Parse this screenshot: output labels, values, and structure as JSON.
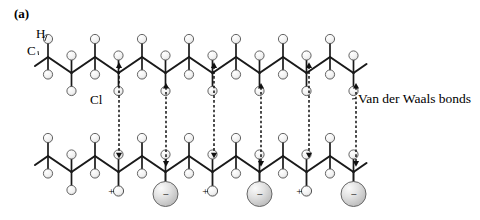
{
  "figure": {
    "panel_label": "(a)",
    "caption_labels": {
      "hydrogen": "H",
      "carbon": "C",
      "chlorine": "Cl",
      "vdw": "Van der Waals bonds"
    },
    "charge_signs": {
      "negative": "−",
      "positive": "+"
    }
  },
  "colors": {
    "carbon": "#2b2b2b",
    "carbon_highlight": "#8a8a8a",
    "hydrogen": "#f2f2f2",
    "hydrogen_outline": "#555555",
    "chlorine": "#d0d0d0",
    "chlorine_outline": "#666666",
    "bond": "#1a1a1a",
    "background": "#ffffff",
    "text": "#000000"
  },
  "geometry": {
    "chain_top": {
      "carbon_y_upper": 57,
      "carbon_y_lower": 73,
      "x_start": 48,
      "x_step": 23.5,
      "count": 14
    },
    "chain_bottom": {
      "carbon_y_upper": 156,
      "carbon_y_lower": 172,
      "x_start": 48,
      "x_step": 23.5,
      "count": 14
    },
    "carbon_radius": 10.5,
    "hydrogen_radius": 4.6,
    "chlorine_radius": 12.5
  },
  "chain_top": {
    "name": "upper-polymer-chain",
    "chlorine_x": [
      119,
      214,
      309
    ],
    "hydrogen_plus_x": [
      166,
      261,
      356
    ],
    "chlorine_y": 48,
    "substituent_label": "Cl"
  },
  "chain_bottom": {
    "name": "lower-polymer-chain",
    "chlorine_x": [
      166,
      261,
      356
    ],
    "hydrogen_plus_x": [
      119,
      214,
      309
    ],
    "chlorine_y": 181,
    "substituent_label": "Cl"
  },
  "interchain": {
    "pairs": [
      {
        "x": 119,
        "top": "chlorine",
        "bottom": "hydrogen"
      },
      {
        "x": 166,
        "top": "hydrogen",
        "bottom": "chlorine"
      },
      {
        "x": 214,
        "top": "chlorine",
        "bottom": "hydrogen"
      },
      {
        "x": 261,
        "top": "hydrogen",
        "bottom": "chlorine"
      },
      {
        "x": 309,
        "top": "chlorine",
        "bottom": "hydrogen"
      },
      {
        "x": 356,
        "top": "hydrogen",
        "bottom": "chlorine"
      }
    ],
    "arrow_style": "double-headed-dashed"
  },
  "annotations": {
    "panel": {
      "text": "(a)",
      "x": 14,
      "y": 18
    },
    "h_label": {
      "text": "H",
      "x": 36,
      "y": 38
    },
    "c_label": {
      "text": "C",
      "x": 27,
      "y": 55
    },
    "cl_label": {
      "text": "Cl",
      "x": 90,
      "y": 104
    },
    "vdw_label": {
      "text": "Van der Waals bonds",
      "x": 358,
      "y": 103
    },
    "vdw_leader": {
      "x1": 352,
      "y1": 99,
      "x2": 366,
      "y2": 91
    }
  }
}
